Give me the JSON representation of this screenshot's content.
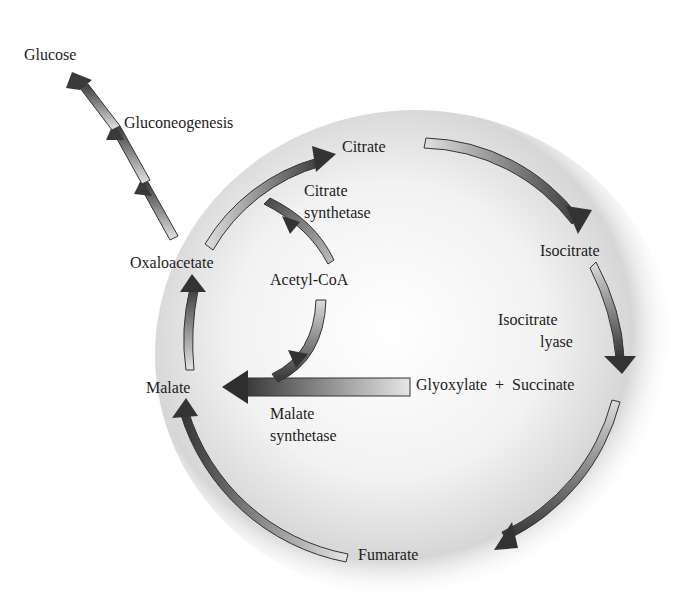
{
  "diagram": {
    "nodes": {
      "glucose": "Glucose",
      "gluconeogenesis": "Gluconeogenesis",
      "citrate": "Citrate",
      "citrate_synthetase_1": "Citrate",
      "citrate_synthetase_2": "synthetase",
      "oxaloacetate": "Oxaloacetate",
      "acetyl_coa": "Acetyl-CoA",
      "isocitrate": "Isocitrate",
      "isocitrate_lyase_1": "Isocitrate",
      "isocitrate_lyase_2": "lyase",
      "malate": "Malate",
      "glyoxylate_succinate": "Glyoxylate  +  Succinate",
      "malate_synthetase_1": "Malate",
      "malate_synthetase_2": "synthetase",
      "fumarate": "Fumarate"
    },
    "edges": [
      {
        "from": "Oxaloacetate",
        "to": "Citrate",
        "enzyme": "Citrate synthetase",
        "cofactor": "Acetyl-CoA"
      },
      {
        "from": "Citrate",
        "to": "Isocitrate"
      },
      {
        "from": "Isocitrate",
        "to": "Glyoxylate + Succinate",
        "enzyme": "Isocitrate lyase"
      },
      {
        "from": "Glyoxylate",
        "to": "Malate",
        "enzyme": "Malate synthetase",
        "cofactor": "Acetyl-CoA"
      },
      {
        "from": "Succinate",
        "to": "Fumarate"
      },
      {
        "from": "Fumarate",
        "to": "Malate"
      },
      {
        "from": "Malate",
        "to": "Oxaloacetate"
      },
      {
        "from": "Oxaloacetate",
        "to": "Glucose",
        "process": "Gluconeogenesis"
      }
    ],
    "colors": {
      "arrow_dark": "#3a3a3a",
      "arrow_light": "#d8d8d8",
      "background_circle": "#c8c8c8"
    }
  }
}
